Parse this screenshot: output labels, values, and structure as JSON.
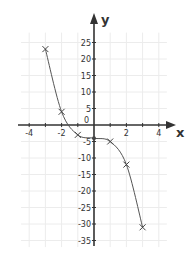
{
  "chart_data": {
    "type": "line",
    "title": "",
    "xlabel": "x",
    "ylabel": "y",
    "xlim": [
      -4.5,
      4.8
    ],
    "ylim": [
      -37,
      30
    ],
    "grid": true,
    "legend": null,
    "x_ticks": [
      -4,
      -2,
      0,
      2,
      4
    ],
    "x_tick_labels": [
      "-4",
      "-2",
      "0",
      "2",
      "4"
    ],
    "y_ticks": [
      25,
      20,
      15,
      10,
      5,
      -5,
      -10,
      -15,
      -20,
      -25,
      -30,
      -35
    ],
    "y_tick_labels": [
      "25",
      "20",
      "15",
      "10",
      "5",
      "-5",
      "-10",
      "-15",
      "-20",
      "-25",
      "-30",
      "-35"
    ],
    "origin_label": "0",
    "series": [
      {
        "name": "curve",
        "marker": "x",
        "x": [
          -3,
          -2,
          -1,
          0,
          1,
          2,
          3
        ],
        "y": [
          23,
          4,
          -3,
          -4,
          -5,
          -12,
          -31
        ]
      }
    ]
  },
  "colors": {
    "axis": "#333333",
    "grid": "#ececec",
    "curve": "#555555",
    "marker": "#444444",
    "background": "#ffffff"
  }
}
